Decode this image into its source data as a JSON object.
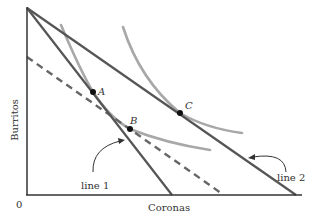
{
  "diagram": {
    "axes": {
      "x_label": "Coronas",
      "y_label": "Burritos",
      "origin_label": "0"
    },
    "points": [
      {
        "id": "A",
        "label": "A"
      },
      {
        "id": "B",
        "label": "B"
      },
      {
        "id": "C",
        "label": "C"
      }
    ],
    "lines": [
      {
        "id": "line1",
        "label": "line 1",
        "style": "solid"
      },
      {
        "id": "line2",
        "label": "line 2",
        "style": "solid"
      },
      {
        "id": "dashed",
        "label": "",
        "style": "dashed"
      }
    ],
    "curves": [
      {
        "id": "indifference-low",
        "passes_through": [
          "A",
          "B"
        ]
      },
      {
        "id": "indifference-high",
        "passes_through": [
          "C"
        ]
      }
    ],
    "colors": {
      "budget_line": "#555555",
      "indifference_curve": "#a8a8a8",
      "axis": "#333333",
      "point": "#111111",
      "text": "#333333"
    }
  }
}
